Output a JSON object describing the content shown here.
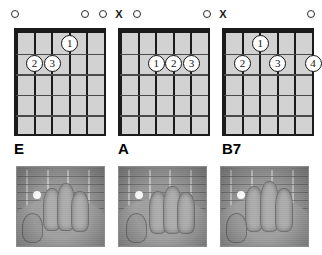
{
  "page": {
    "diagram_count": 3,
    "strings": 6,
    "frets": 5
  },
  "colors": {
    "grid_fill": "#d2d2d2",
    "line": "#1b1b1b",
    "fret": "#4a4a4a",
    "dot_fill": "#ffffff",
    "text": "#000000",
    "photo_board": "#1d1b19",
    "photo_skin": "#b3a898"
  },
  "legend": {
    "open_symbol": "O",
    "muted_symbol": "X"
  },
  "chords": [
    {
      "name": "E",
      "markers": [
        {
          "string": 6,
          "symbol": "O"
        },
        {
          "string": 2,
          "symbol": "O"
        },
        {
          "string": 1,
          "symbol": "O"
        }
      ],
      "fingers": [
        {
          "finger": "1",
          "string": 3,
          "fret": 1
        },
        {
          "finger": "2",
          "string": 5,
          "fret": 2
        },
        {
          "finger": "3",
          "string": 4,
          "fret": 2
        }
      ],
      "photo_caption": "E chord hand position"
    },
    {
      "name": "A",
      "markers": [
        {
          "string": 6,
          "symbol": "X"
        },
        {
          "string": 5,
          "symbol": "O"
        },
        {
          "string": 1,
          "symbol": "O"
        }
      ],
      "fingers": [
        {
          "finger": "1",
          "string": 4,
          "fret": 2
        },
        {
          "finger": "2",
          "string": 3,
          "fret": 2
        },
        {
          "finger": "3",
          "string": 2,
          "fret": 2
        }
      ],
      "photo_caption": "A chord hand position"
    },
    {
      "name": "B7",
      "markers": [
        {
          "string": 6,
          "symbol": "X"
        },
        {
          "string": 1,
          "symbol": "O"
        }
      ],
      "fingers": [
        {
          "finger": "1",
          "string": 4,
          "fret": 1
        },
        {
          "finger": "2",
          "string": 5,
          "fret": 2
        },
        {
          "finger": "3",
          "string": 3,
          "fret": 2
        },
        {
          "finger": "4",
          "string": 1,
          "fret": 2
        }
      ],
      "photo_caption": "B7 chord hand position"
    }
  ]
}
